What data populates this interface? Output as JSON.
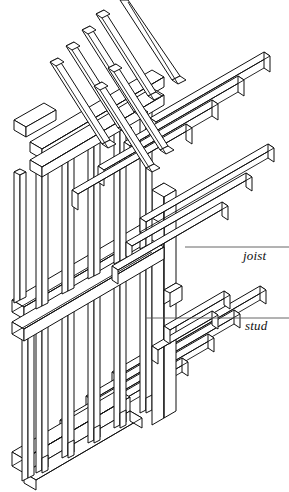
{
  "figure": {
    "background_color": "#ffffff",
    "line_color": "#111111",
    "canvas": {
      "width": 289,
      "height": 492
    }
  },
  "annotations": [
    {
      "id": "joist",
      "label": "joist",
      "leader": {
        "x1": 185,
        "y1": 247,
        "x2": 289,
        "y2": 247
      },
      "text_position": {
        "x": 243,
        "y": 249
      }
    },
    {
      "id": "stud",
      "label": "stud",
      "leader": {
        "x1": 145,
        "y1": 318,
        "x2": 289,
        "y2": 318
      },
      "text_position": {
        "x": 245,
        "y": 319
      }
    }
  ],
  "members": {
    "rafters": {
      "name": "rafters",
      "count": 6,
      "description": "steeply pitched roof rafters rising to the left",
      "origin": {
        "x": 104,
        "y": 132
      },
      "step": {
        "x": 26,
        "y": 24
      },
      "run": {
        "x": -52,
        "y": -108
      },
      "thickness": 7,
      "depth": 12
    },
    "ceiling_joists": {
      "name": "ceiling joists",
      "count": 6,
      "description": "horizontal ceiling joists projecting to the right",
      "origin": {
        "x": 104,
        "y": 128
      },
      "step": {
        "x": 26,
        "y": 24
      },
      "run": {
        "x": 148,
        "y": -86
      },
      "thickness": 5,
      "depth": 14
    },
    "floor_joists": {
      "name": "floor joists",
      "count": 6,
      "description": "lower floor joists projecting to the right",
      "origin": {
        "x": 110,
        "y": 388
      },
      "step": {
        "x": 26,
        "y": 24
      },
      "run": {
        "x": 148,
        "y": -86
      },
      "thickness": 5,
      "depth": 14
    },
    "studs": {
      "name": "studs",
      "upper_count": 6,
      "lower_count": 7,
      "description": "vertical wall studs in upper and lower storeys",
      "width": 5,
      "depth": 5
    },
    "wall_plates": {
      "name": "wall plates",
      "count": 4,
      "description": "horizontal top, mid and sill plates running back-left"
    },
    "sill_plate": {
      "name": "sill plate",
      "description": "bottom sill plate carrying tenoned stud feet"
    },
    "corner_post": {
      "name": "corner post",
      "description": "heavy vertical corner post at the front angle"
    }
  }
}
